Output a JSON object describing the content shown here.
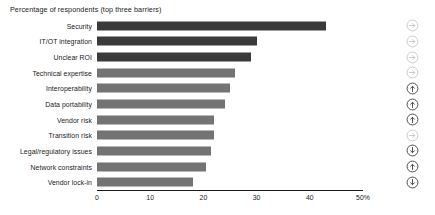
{
  "chart_data": {
    "type": "bar",
    "orientation": "horizontal",
    "title": "Percentage of respondents (top three barriers)",
    "xlabel": "",
    "ylabel": "",
    "xlim": [
      0,
      50
    ],
    "grid": false,
    "legend": "none",
    "categories": [
      "Security",
      "IT/OT integration",
      "Unclear ROI",
      "Technical expertise",
      "Interoperability",
      "Data portability",
      "Vendor risk",
      "Transition risk",
      "Legal/regulatory issues",
      "Network constraints",
      "Vendor lock-in"
    ],
    "values": [
      43,
      30,
      29,
      26,
      25,
      24,
      22,
      22,
      21.5,
      20.5,
      18
    ],
    "bar_colors": [
      "#3a3a3a",
      "#3a3a3a",
      "#3a3a3a",
      "#737373",
      "#737373",
      "#737373",
      "#737373",
      "#737373",
      "#737373",
      "#737373",
      "#737373"
    ],
    "tick_values": [
      0,
      10,
      20,
      30,
      40,
      50
    ],
    "tick_labels": [
      "0",
      "10",
      "20",
      "30",
      "40",
      "50%"
    ],
    "axis_color": "#1b1b1b"
  },
  "icon_rail": {
    "items": [
      {
        "name": "arrow-right-circle-icon",
        "direction": "right",
        "tone": "light"
      },
      {
        "name": "arrow-right-circle-icon",
        "direction": "right",
        "tone": "light"
      },
      {
        "name": "arrow-right-circle-icon",
        "direction": "right",
        "tone": "light"
      },
      {
        "name": "arrow-right-circle-icon",
        "direction": "right",
        "tone": "light"
      },
      {
        "name": "arrow-up-circle-icon",
        "direction": "up",
        "tone": "dark"
      },
      {
        "name": "arrow-up-circle-icon",
        "direction": "up",
        "tone": "dark"
      },
      {
        "name": "arrow-up-circle-icon",
        "direction": "up",
        "tone": "dark"
      },
      {
        "name": "arrow-right-circle-icon",
        "direction": "right",
        "tone": "light"
      },
      {
        "name": "arrow-down-circle-icon",
        "direction": "down",
        "tone": "dark"
      },
      {
        "name": "arrow-up-circle-icon",
        "direction": "up",
        "tone": "dark"
      },
      {
        "name": "arrow-down-circle-icon",
        "direction": "down",
        "tone": "dark"
      }
    ],
    "light_color": "#c9c9c9",
    "dark_color": "#4a4a4a"
  }
}
